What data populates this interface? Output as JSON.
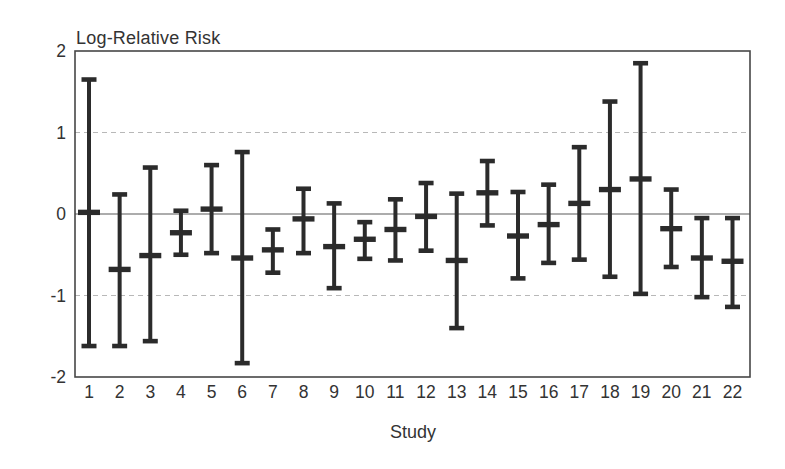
{
  "page": {
    "background_color": "#ffffff"
  },
  "chart_data": {
    "type": "errorbar",
    "title": "Log-Relative Risk",
    "xlabel": "Study",
    "ylabel": "Log-Relative Risk",
    "ylim": [
      -2,
      2
    ],
    "yticks": [
      2,
      1,
      0,
      -1,
      -2
    ],
    "ytick_labels": [
      "2",
      "1",
      "0",
      "-1",
      "-2"
    ],
    "grid": {
      "dashed_lines_at": [
        1,
        -1
      ],
      "solid_line_at": 0,
      "frame": true,
      "legend": "none"
    },
    "categories": [
      "1",
      "2",
      "3",
      "4",
      "5",
      "6",
      "7",
      "8",
      "9",
      "10",
      "11",
      "12",
      "13",
      "14",
      "15",
      "16",
      "17",
      "18",
      "19",
      "20",
      "21",
      "22"
    ],
    "series": [
      {
        "name": "log-relative-risk-with-confidence-interval",
        "points": [
          {
            "category": "1",
            "center": 0.02,
            "lower": -1.62,
            "upper": 1.65
          },
          {
            "category": "2",
            "center": -0.68,
            "lower": -1.62,
            "upper": 0.24
          },
          {
            "category": "3",
            "center": -0.51,
            "lower": -1.56,
            "upper": 0.57
          },
          {
            "category": "4",
            "center": -0.23,
            "lower": -0.5,
            "upper": 0.04
          },
          {
            "category": "5",
            "center": 0.06,
            "lower": -0.48,
            "upper": 0.6
          },
          {
            "category": "6",
            "center": -0.54,
            "lower": -1.83,
            "upper": 0.76
          },
          {
            "category": "7",
            "center": -0.44,
            "lower": -0.72,
            "upper": -0.19
          },
          {
            "category": "8",
            "center": -0.06,
            "lower": -0.48,
            "upper": 0.31
          },
          {
            "category": "9",
            "center": -0.4,
            "lower": -0.91,
            "upper": 0.13
          },
          {
            "category": "10",
            "center": -0.31,
            "lower": -0.55,
            "upper": -0.1
          },
          {
            "category": "11",
            "center": -0.19,
            "lower": -0.57,
            "upper": 0.18
          },
          {
            "category": "12",
            "center": -0.03,
            "lower": -0.45,
            "upper": 0.38
          },
          {
            "category": "13",
            "center": -0.57,
            "lower": -1.4,
            "upper": 0.25
          },
          {
            "category": "14",
            "center": 0.26,
            "lower": -0.14,
            "upper": 0.65
          },
          {
            "category": "15",
            "center": -0.27,
            "lower": -0.79,
            "upper": 0.27
          },
          {
            "category": "16",
            "center": -0.13,
            "lower": -0.6,
            "upper": 0.36
          },
          {
            "category": "17",
            "center": 0.13,
            "lower": -0.56,
            "upper": 0.82
          },
          {
            "category": "18",
            "center": 0.3,
            "lower": -0.77,
            "upper": 1.38
          },
          {
            "category": "19",
            "center": 0.43,
            "lower": -0.98,
            "upper": 1.85
          },
          {
            "category": "20",
            "center": -0.18,
            "lower": -0.65,
            "upper": 0.3
          },
          {
            "category": "21",
            "center": -0.54,
            "lower": -1.02,
            "upper": -0.05
          },
          {
            "category": "22",
            "center": -0.58,
            "lower": -1.14,
            "upper": -0.05
          }
        ]
      }
    ]
  },
  "colors": {
    "bar": "#2b2b2b",
    "frame": "#474747",
    "zero_line": "#5a5a5a",
    "grid_dashed": "#b8b8b8",
    "text": "#333333",
    "background": "#ffffff"
  }
}
